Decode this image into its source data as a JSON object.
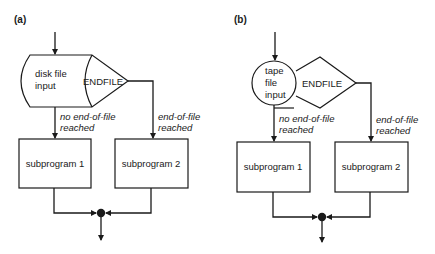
{
  "panels": [
    {
      "label": "(a)",
      "input_symbol": "disk",
      "input_text": [
        "disk file",
        "input"
      ],
      "decision_text": "ENDFILE",
      "left_branch": [
        "no end-of-file",
        "reached"
      ],
      "right_branch": [
        "end-of-file",
        "reached"
      ],
      "box1": "subprogram 1",
      "box2": "subprogram 2"
    },
    {
      "label": "(b)",
      "input_symbol": "circle",
      "input_text": [
        "tape",
        "file",
        "input"
      ],
      "decision_text": "ENDFILE",
      "left_branch": [
        "no end-of-file",
        "reached"
      ],
      "right_branch": [
        "end-of-file",
        "reached"
      ],
      "box1": "subprogram 1",
      "box2": "subprogram 2"
    }
  ],
  "colors": {
    "stroke": "#1a1a1a",
    "background": "#ffffff"
  }
}
